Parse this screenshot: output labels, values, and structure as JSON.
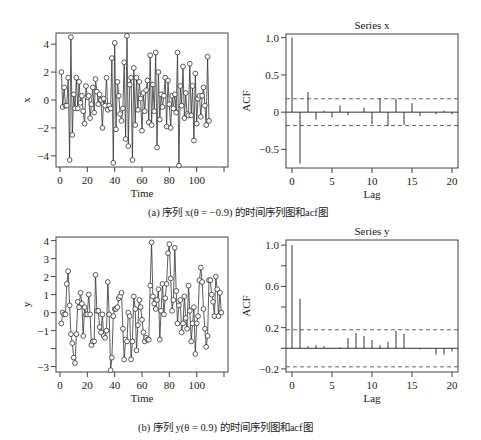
{
  "captions": {
    "a": "(a) 序列 x(θ = −0.9) 的时间序列图和acf图",
    "b": "(b) 序列 y(θ = 0.9) 的时间序列图和acf图"
  },
  "colors": {
    "line": "#333333",
    "frame": "#444444",
    "dashed": "#555555"
  },
  "chart_data": [
    {
      "id": "ts-x",
      "type": "line",
      "title": "",
      "xlabel": "Time",
      "ylabel": "x",
      "xlim": [
        0,
        120
      ],
      "ylim": [
        -4.8,
        4.8
      ],
      "xticks": [
        0,
        20,
        40,
        60,
        80,
        100
      ],
      "xticks_unlabeled": [
        120
      ],
      "yticks": [
        -4,
        -2,
        0,
        2,
        4
      ],
      "ytick_labels": [
        "−4",
        "−2",
        "0",
        "2",
        "4"
      ],
      "markers": "open-circle",
      "y": [
        2.0,
        -0.5,
        0.9,
        -0.4,
        -0.4,
        1.6,
        -4.3,
        4.5,
        -2.5,
        0.4,
        -0.6,
        1.6,
        -0.6,
        1.3,
        -0.2,
        0.3,
        -0.8,
        -1.7,
        1.0,
        0.2,
        0.3,
        -1.3,
        -0.3,
        0.9,
        -0.9,
        1.5,
        0.6,
        -0.3,
        0.4,
        0.0,
        -2.0,
        0.1,
        -0.4,
        1.6,
        -0.7,
        -0.4,
        -0.6,
        3.0,
        -4.5,
        4.1,
        -2.1,
        1.3,
        0.3,
        -1.0,
        -1.5,
        -0.6,
        2.7,
        -2.8,
        4.6,
        -3.3,
        1.1,
        1.6,
        -4.3,
        2.3,
        -1.8,
        1.6,
        -0.7,
        1.3,
        0.1,
        -2.2,
        0.5,
        -0.8,
        0.7,
        1.4,
        -1.6,
        3.2,
        -1.8,
        1.1,
        -0.8,
        3.4,
        -3.4,
        2.0,
        -1.4,
        0.4,
        -0.5,
        0.3,
        1.6,
        -1.9,
        1.4,
        -0.3,
        -2.0,
        0.3,
        -0.6,
        0.4,
        -0.9,
        3.4,
        -4.7,
        1.0,
        -0.4,
        2.4,
        -1.3,
        0.5,
        -1.0,
        -1.1,
        2.6,
        -1.1,
        1.0,
        -2.9,
        1.9,
        -1.7,
        0.1,
        0.3,
        -1.2,
        0.3,
        0.9,
        -0.4,
        -1.8,
        3.1,
        -1.5
      ]
    },
    {
      "id": "acf-x",
      "type": "bar",
      "title": "Series  x",
      "xlabel": "Lag",
      "ylabel": "ACF",
      "xlim": [
        0,
        20
      ],
      "ylim": [
        -0.75,
        1.05
      ],
      "xticks": [
        0,
        5,
        10,
        15,
        20
      ],
      "yticks": [
        -0.5,
        0,
        0.5,
        1.0
      ],
      "ytick_labels": [
        "−0.5",
        "0",
        "0.5",
        "1.0"
      ],
      "lags": [
        0,
        1,
        2,
        3,
        4,
        5,
        6,
        7,
        8,
        9,
        10,
        11,
        12,
        13,
        14,
        15,
        16,
        17,
        18,
        19,
        20
      ],
      "values": [
        1.0,
        -0.69,
        0.27,
        -0.1,
        0.02,
        -0.07,
        0.09,
        -0.04,
        0.0,
        0.06,
        -0.16,
        0.19,
        -0.19,
        0.18,
        -0.17,
        0.12,
        -0.05,
        0.0,
        -0.03,
        0.02,
        -0.03
      ],
      "ci": 0.18
    },
    {
      "id": "ts-y",
      "type": "line",
      "title": "",
      "xlabel": "Time",
      "ylabel": "y",
      "xlim": [
        0,
        120
      ],
      "ylim": [
        -3.3,
        4.2
      ],
      "xticks": [
        0,
        20,
        40,
        60,
        80,
        100
      ],
      "xticks_unlabeled": [
        120
      ],
      "yticks": [
        -3,
        -2,
        -1,
        0,
        1,
        2,
        3,
        4
      ],
      "ytick_labels": [
        "−3",
        "",
        "−1",
        "0",
        "1",
        "2",
        "3",
        "4"
      ],
      "markers": "open-circle",
      "y": [
        -0.6,
        0.0,
        -0.1,
        -0.1,
        1.6,
        2.3,
        0.4,
        -1.2,
        -1.7,
        -2.5,
        -2.8,
        -1.2,
        0.6,
        0.3,
        1.1,
        0.5,
        -1.3,
        0.3,
        -0.1,
        -0.1,
        1.0,
        -0.1,
        -1.8,
        -1.6,
        -1.6,
        2.1,
        0.1,
        0.1,
        -0.8,
        -1.1,
        -0.1,
        -1.3,
        -1.4,
        -1.0,
        1.7,
        -0.1,
        -3.2,
        -2.5,
        -0.2,
        0.2,
        0.2,
        0.3,
        0.8,
        0.9,
        1.1,
        -0.9,
        -2.6,
        -1.5,
        -1.6,
        0.0,
        -0.2,
        -2.6,
        -1.6,
        0.9,
        0.2,
        -2.1,
        -0.7,
        0.7,
        0.3,
        -0.4,
        -1.1,
        -1.6,
        -1.4,
        -1.5,
        -1.5,
        1.5,
        3.9,
        0.9,
        0.5,
        0.2,
        0.7,
        1.3,
        -1.5,
        0.1,
        1.6,
        -0.1,
        0.8,
        1.6,
        3.3,
        3.8,
        1.9,
        0.1,
        0.7,
        3.6,
        1.2,
        -0.6,
        0.4,
        0.7,
        -1.1,
        -0.6,
        0.9,
        -0.3,
        -0.9,
        1.5,
        0.1,
        -1.6,
        -0.6,
        0.3,
        -2.3,
        -0.6,
        -0.2,
        1.8,
        2.5,
        1.7,
        0.2,
        -0.9,
        -1.9,
        -1.3,
        1.8,
        1.8,
        1.0,
        0.6,
        -0.2,
        2.0,
        1.3,
        -0.2,
        1.1,
        0.0
      ]
    },
    {
      "id": "acf-y",
      "type": "bar",
      "title": "Series  y",
      "xlabel": "Lag",
      "ylabel": "ACF",
      "xlim": [
        0,
        20
      ],
      "ylim": [
        -0.23,
        1.05
      ],
      "xticks": [
        0,
        5,
        10,
        15,
        20
      ],
      "yticks": [
        -0.2,
        0,
        0.2,
        0.4,
        0.6,
        0.8,
        1.0
      ],
      "ytick_labels": [
        "−0.2",
        "",
        "0.2",
        "",
        "0.6",
        "",
        "1.0"
      ],
      "lags": [
        0,
        1,
        2,
        3,
        4,
        5,
        6,
        7,
        8,
        9,
        10,
        11,
        12,
        13,
        14,
        15,
        16,
        17,
        18,
        19,
        20
      ],
      "values": [
        1.0,
        0.48,
        0.02,
        0.03,
        0.02,
        0.0,
        0.01,
        0.1,
        0.15,
        0.12,
        0.08,
        0.03,
        0.06,
        0.17,
        0.14,
        0.0,
        -0.01,
        0.0,
        -0.06,
        -0.06,
        -0.03
      ],
      "ci": 0.18
    }
  ]
}
